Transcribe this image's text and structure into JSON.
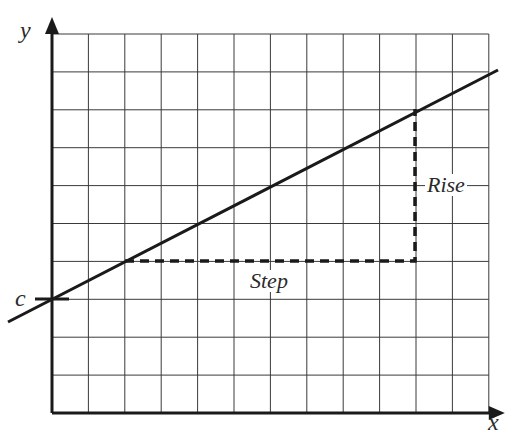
{
  "diagram": {
    "axes": {
      "x_label": "x",
      "y_label": "y"
    },
    "grid": {
      "columns": 12,
      "rows": 10,
      "origin_px": [
        52,
        413
      ],
      "cell_w_px": 36.4,
      "cell_h_px": 37.9
    },
    "line": {
      "start_px": [
        8,
        322
      ],
      "end_px": [
        498,
        70
      ],
      "color": "#1a1a1a"
    },
    "intercept": {
      "label": "c",
      "point_px": [
        52,
        299
      ]
    },
    "step": {
      "label": "Step",
      "from_px": [
        125,
        261
      ],
      "to_px": [
        415,
        261
      ]
    },
    "rise": {
      "label": "Rise",
      "from_px": [
        415,
        261
      ],
      "to_px": [
        415,
        109
      ]
    }
  }
}
